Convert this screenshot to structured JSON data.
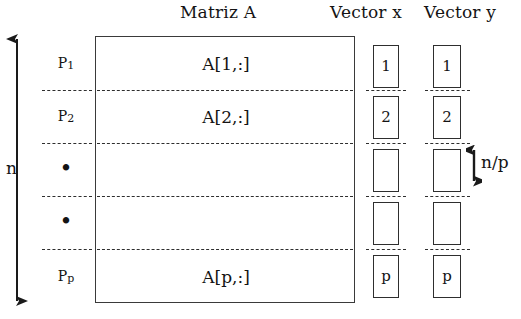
{
  "figure": {
    "headings": {
      "matrix": "Matriz A",
      "vector_x": "Vector x",
      "vector_y": "Vector y"
    },
    "dimension_labels": {
      "total_rows": "n",
      "block_height": "n/p"
    },
    "processors": [
      {
        "name": "P1",
        "base": "P",
        "sub": "1"
      },
      {
        "name": "P2",
        "base": "P",
        "sub": "2"
      },
      {
        "name": "dot",
        "base": "•",
        "sub": ""
      },
      {
        "name": "dot",
        "base": "•",
        "sub": ""
      },
      {
        "name": "Pp",
        "base": "P",
        "sub": "p"
      }
    ],
    "matrix_blocks": [
      "A[1,:]",
      "A[2,:]",
      "",
      "",
      "A[p,:]"
    ],
    "vector_x_blocks": [
      "1",
      "2",
      "",
      "",
      "p"
    ],
    "vector_y_blocks": [
      "1",
      "2",
      "",
      "",
      "p"
    ],
    "colors": {
      "ink": "#1a1a1a",
      "line": "#2e2e2e",
      "frame": "#3a3a3a",
      "background": "#ffffff"
    },
    "geometry": {
      "divider_y": [
        90,
        143,
        196,
        249
      ],
      "band_centers_y": [
        63,
        116,
        169,
        222,
        276
      ],
      "matrix_frame": {
        "x": 95,
        "y": 36,
        "w": 260,
        "h": 267
      }
    }
  }
}
